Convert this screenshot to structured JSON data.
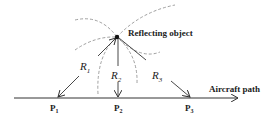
{
  "diagram": {
    "object_label": "Reflecting object",
    "path_label": "Aircraft path",
    "ranges": [
      {
        "label": "R",
        "sub": "1"
      },
      {
        "label": "R",
        "sub": "2"
      },
      {
        "label": "R",
        "sub": "3"
      }
    ],
    "points": [
      {
        "label": "P",
        "sub": "1"
      },
      {
        "label": "P",
        "sub": "2"
      },
      {
        "label": "P",
        "sub": "3"
      }
    ],
    "colors": {
      "line": "#333333",
      "dashed": "#888888",
      "text": "#222222"
    }
  }
}
